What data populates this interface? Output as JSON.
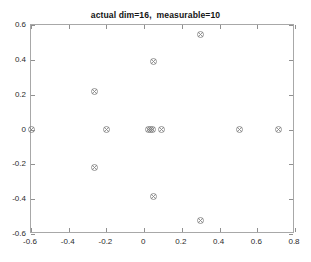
{
  "chart_data": {
    "type": "scatter",
    "title": "actual dim=16,  measurable=10",
    "xlabel": "",
    "ylabel": "",
    "xlim": [
      -0.6,
      0.8
    ],
    "ylim": [
      -0.6,
      0.6
    ],
    "xticks": [
      -0.6,
      -0.4,
      -0.2,
      0,
      0.2,
      0.4,
      0.6,
      0.8
    ],
    "xticklabels": [
      "-0.6",
      "-0.4",
      "-0.2",
      "0",
      "0.2",
      "0.4",
      "0.6",
      "0.8"
    ],
    "yticks": [
      -0.6,
      -0.4,
      -0.2,
      0,
      0.2,
      0.4,
      0.6
    ],
    "yticklabels": [
      "-0.6",
      "-0.4",
      "-0.2",
      "0",
      "0.2",
      "0.4",
      "0.6"
    ],
    "grid": false,
    "legend": null,
    "marker": "circle-x",
    "marker_color": "#808080",
    "points": [
      {
        "x": -0.6,
        "y": 0.0
      },
      {
        "x": -0.265,
        "y": 0.22
      },
      {
        "x": -0.265,
        "y": -0.22
      },
      {
        "x": -0.2,
        "y": 0.0
      },
      {
        "x": 0.025,
        "y": 0.0
      },
      {
        "x": 0.035,
        "y": 0.0
      },
      {
        "x": 0.045,
        "y": 0.0
      },
      {
        "x": 0.09,
        "y": 0.0
      },
      {
        "x": 0.05,
        "y": 0.39
      },
      {
        "x": 0.05,
        "y": -0.385
      },
      {
        "x": 0.3,
        "y": 0.545
      },
      {
        "x": 0.3,
        "y": -0.525
      },
      {
        "x": 0.505,
        "y": 0.0
      },
      {
        "x": 0.71,
        "y": 0.0
      }
    ]
  },
  "figure": {
    "background_color": "#ffffff",
    "axes_color": "#a8a8a8",
    "text_color": "#2b2b2b"
  }
}
